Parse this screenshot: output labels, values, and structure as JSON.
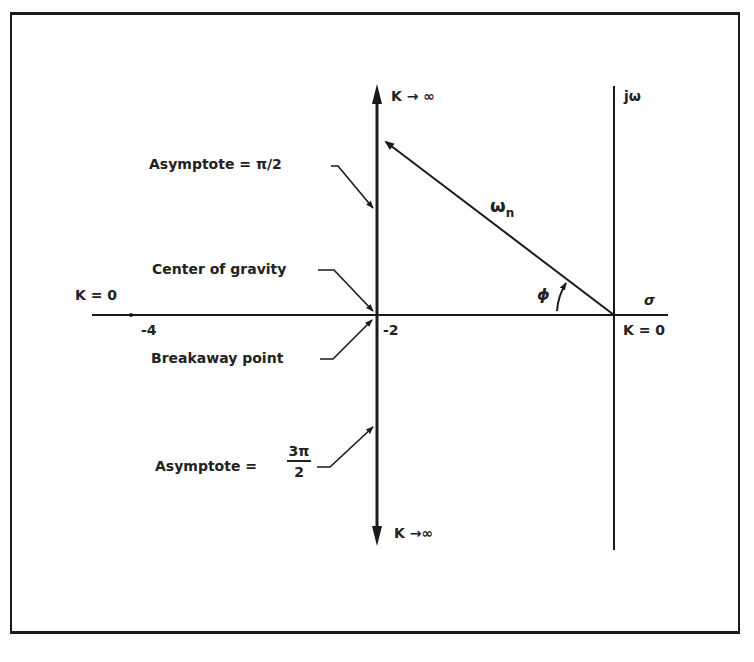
{
  "diagram": {
    "type": "root-locus",
    "axes": {
      "real_axis_label": "σ",
      "imag_axis_label": "jω"
    },
    "tick_labels": {
      "minus4": "-4",
      "minus2": "-2"
    },
    "labels": {
      "k_zero_left": "K = 0",
      "k_zero_origin": "K = 0",
      "k_inf_up": "K → ∞",
      "k_inf_down": "K →∞",
      "asymptote_top": "Asymptote = π/2",
      "center_of_gravity": "Center of gravity",
      "breakaway_point": "Breakaway point",
      "asymptote_bottom_prefix": "Asymptote =",
      "asymptote_bottom_num": "3π",
      "asymptote_bottom_den": "2",
      "omega_n": "ω",
      "omega_n_sub": "n",
      "phi": "ϕ"
    },
    "colors": {
      "ink": "#1a1a1a",
      "background": "#ffffff"
    }
  }
}
